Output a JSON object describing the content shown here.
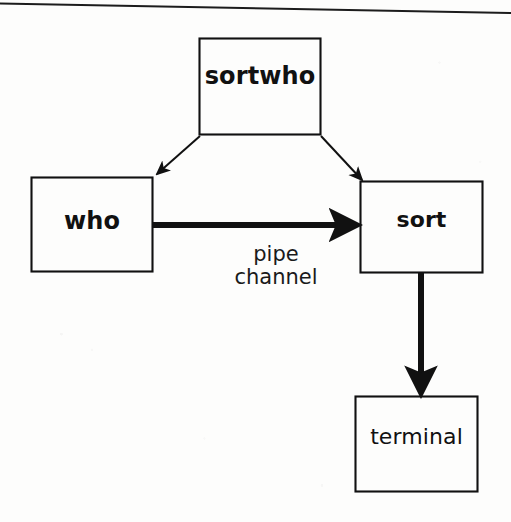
{
  "figure": {
    "type": "process-flow-diagram",
    "background_color": "#fdfdfc",
    "ink_color": "#111111",
    "width": 511,
    "height": 522
  },
  "rule": {
    "name": "top-horizontal-rule",
    "x1": 0,
    "y1": 4,
    "x2": 511,
    "y2": 13,
    "color": "#1a1a1a",
    "thickness": 2
  },
  "nodes": [
    {
      "id": "sortwho",
      "label": "sortwho",
      "weight": "bold",
      "x": 199,
      "y": 38,
      "w": 122,
      "h": 97
    },
    {
      "id": "who",
      "label": "who",
      "weight": "bold",
      "x": 31,
      "y": 177,
      "w": 122,
      "h": 95
    },
    {
      "id": "sort",
      "label": "sort",
      "weight": "bold",
      "x": 360,
      "y": 181,
      "w": 123,
      "h": 92
    },
    {
      "id": "terminal",
      "label": "terminal",
      "weight": "regular",
      "x": 355,
      "y": 396,
      "w": 123,
      "h": 96
    }
  ],
  "edges": [
    {
      "id": "sortwho-to-who",
      "from": "sortwho",
      "to": "who",
      "style": "thin-diagonal-arrow",
      "label": "",
      "x1": 200,
      "y1": 136,
      "x2": 154,
      "y2": 176
    },
    {
      "id": "sortwho-to-sort",
      "from": "sortwho",
      "to": "sort",
      "style": "thin-diagonal-arrow",
      "label": "",
      "x1": 321,
      "y1": 136,
      "x2": 364,
      "y2": 181
    },
    {
      "id": "who-to-sort",
      "from": "who",
      "to": "sort",
      "style": "thick-horizontal-arrow",
      "label_lines": [
        "pipe",
        "channel"
      ],
      "x1": 152,
      "y1": 225,
      "x2": 360,
      "y2": 225
    },
    {
      "id": "sort-to-terminal",
      "from": "sort",
      "to": "terminal",
      "style": "thick-vertical-arrow",
      "label": "",
      "x1": 421,
      "y1": 273,
      "x2": 421,
      "y2": 396
    }
  ],
  "edge_labels": {
    "pipe_channel": {
      "line1": "pipe",
      "line2": "channel"
    }
  }
}
